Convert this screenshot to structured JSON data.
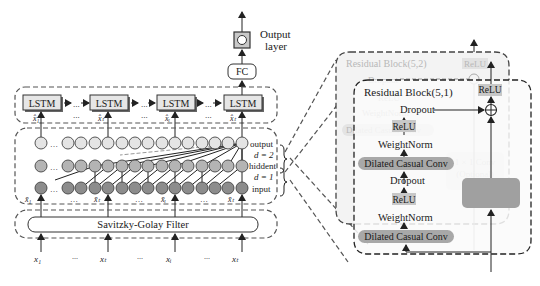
{
  "left_panel": {
    "output_layer": {
      "label_line1": "Output",
      "label_line2": "layer"
    },
    "fc": {
      "label": "FC"
    },
    "lstm": {
      "cells": [
        {
          "label": "LSTM",
          "input": "x̂₁"
        },
        {
          "label": "LSTM",
          "input": "x̂ₜ"
        },
        {
          "label": "LSTM",
          "input": "x̂ᵢ"
        },
        {
          "label": "LSTM",
          "input": "x̂ₜ"
        }
      ],
      "ellipsis": "..."
    },
    "tcn_layers": {
      "output_label": "output",
      "d2_label": "d = 2",
      "hidden_label": "hiddent",
      "d1_label": "d = 1",
      "input_label": "input",
      "inputs": [
        "x̄₁",
        "x̄ₜ",
        "x̄ᵢ",
        "x̄ₜ"
      ],
      "colors": {
        "output": "#e4e4e4",
        "hidden": "#b4b4b4",
        "input": "#8c8c8c"
      }
    },
    "filter": {
      "label": "Savitzky-Golay Filter"
    },
    "raw_inputs": [
      "x₁",
      "xₜ",
      "xᵢ",
      "xₜ"
    ],
    "ellipsis": "..."
  },
  "right_panel": {
    "back_block": {
      "title": "Residual Block(5,2)",
      "relu": "ReLU",
      "dropout": "Dropout",
      "relu_small": "ReLU",
      "weightnorm": "WeightNorm",
      "dilated_conv": "Dilated Casual Conv",
      "conv1x1": "1 × 1 Conv",
      "optional": "(Optional)"
    },
    "front_block": {
      "title": "Residual Block(5,1)",
      "relu_out": "ReLU",
      "dropout1": "Dropout",
      "relu1": "ReLU",
      "weightnorm1": "WeightNorm",
      "dilated_conv1": "Dilated Casual Conv",
      "dropout2": "Dropout",
      "relu2": "ReLU",
      "weightnorm2": "WeightNorm",
      "dilated_conv2": "Dilated Casual Conv",
      "add_symbol": "⊕"
    },
    "colors": {
      "conv_fill": "#a8a8a8",
      "relu_fill": "#c8c8c8",
      "panel_fill": "#f2f2f2",
      "skip_fill": "#a0a0a0"
    }
  }
}
